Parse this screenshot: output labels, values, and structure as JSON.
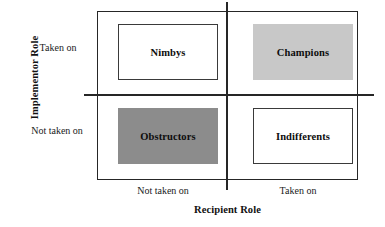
{
  "chart_data": {
    "type": "table",
    "title": "",
    "xlabel": "Recipient Role",
    "ylabel": "Implementor Role",
    "x_tick_labels": [
      "Not taken on",
      "Taken on"
    ],
    "y_tick_labels": [
      "Taken on",
      "Not taken on"
    ],
    "grid": false,
    "legend": "none",
    "cells": [
      {
        "label": "Nimbys",
        "recipient_role": "Not taken on",
        "implementor_role": "Taken on",
        "fill": "#ffffff",
        "outlined": true
      },
      {
        "label": "Champions",
        "recipient_role": "Taken on",
        "implementor_role": "Taken on",
        "fill": "#c8c8c8",
        "outlined": false
      },
      {
        "label": "Obstructors",
        "recipient_role": "Not taken on",
        "implementor_role": "Not taken on",
        "fill": "#8c8c8c",
        "outlined": false
      },
      {
        "label": "Indifferents",
        "recipient_role": "Taken on",
        "implementor_role": "Not taken on",
        "fill": "#ffffff",
        "outlined": true
      }
    ]
  },
  "axes": {
    "y_title": "Implementor Role",
    "x_title": "Recipient Role",
    "y_tick_top": "Taken on",
    "y_tick_bottom": "Not taken on",
    "x_tick_left": "Not taken on",
    "x_tick_right": "Taken on"
  },
  "colors": {
    "line": "#262626",
    "text": "#111111",
    "fill_light_gray": "#c8c8c8",
    "fill_dark_gray": "#8c8c8c",
    "fill_white": "#ffffff"
  }
}
